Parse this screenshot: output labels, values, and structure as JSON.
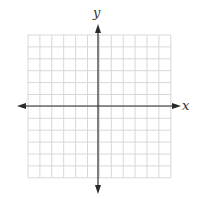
{
  "diagram": {
    "type": "coordinate-plane",
    "x_axis_label": "x",
    "y_axis_label": "y",
    "grid": {
      "columns": 12,
      "rows": 12,
      "left": 28,
      "top": 35,
      "cell": 11.9,
      "line_color": "#d8d8d8"
    },
    "axes": {
      "color": "#2a2a2a",
      "origin_x": 98,
      "origin_y": 106,
      "x_start": 17,
      "x_end": 181,
      "y_start": 24,
      "y_end": 194
    }
  }
}
